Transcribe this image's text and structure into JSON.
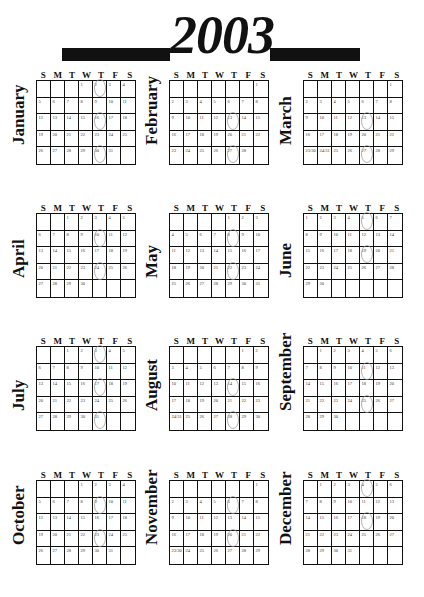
{
  "title": {
    "year": "2003"
  },
  "weekday_headers": [
    "S",
    "M",
    "T",
    "W",
    "T",
    "F",
    "S"
  ],
  "months": [
    {
      "name": "January",
      "start": 3,
      "cells": [
        "",
        "",
        "",
        "1",
        "2",
        "3",
        "4",
        "5",
        "6",
        "7",
        "8",
        "9",
        "10",
        "11",
        "12",
        "13",
        "14",
        "15",
        "16",
        "17",
        "18",
        "19",
        "20",
        "21",
        "22",
        "23",
        "24",
        "25",
        "26",
        "27",
        "28",
        "29",
        "30",
        "31",
        "",
        "",
        "",
        ""
      ],
      "circled": [
        "2",
        "16",
        "30"
      ]
    },
    {
      "name": "February",
      "start": 6,
      "cells": [
        "",
        "",
        "",
        "",
        "",
        "",
        "1",
        "2",
        "3",
        "4",
        "5",
        "6",
        "7",
        "8",
        "9",
        "10",
        "11",
        "12",
        "13",
        "14",
        "15",
        "16",
        "17",
        "18",
        "19",
        "20",
        "21",
        "22",
        "23",
        "24",
        "25",
        "26",
        "27",
        "28",
        ""
      ],
      "circled": [
        "13",
        "27"
      ]
    },
    {
      "name": "March",
      "start": 6,
      "cells": [
        "",
        "",
        "",
        "",
        "",
        "",
        "1",
        "2",
        "3",
        "4",
        "5",
        "6",
        "7",
        "8",
        "9",
        "10",
        "11",
        "12",
        "13",
        "14",
        "15",
        "16",
        "17",
        "18",
        "19",
        "20",
        "21",
        "22",
        "23/30",
        "24/31",
        "25",
        "26",
        "27",
        "28",
        "29"
      ],
      "circled": [
        "13",
        "27"
      ]
    },
    {
      "name": "April",
      "start": 2,
      "cells": [
        "",
        "",
        "1",
        "2",
        "3",
        "4",
        "5",
        "6",
        "7",
        "8",
        "9",
        "10",
        "11",
        "12",
        "13",
        "14",
        "15",
        "16",
        "17",
        "18",
        "19",
        "20",
        "21",
        "22",
        "23",
        "24",
        "25",
        "26",
        "27",
        "28",
        "29",
        "30",
        "",
        "",
        "",
        "",
        ""
      ],
      "circled": [
        "10",
        "24"
      ]
    },
    {
      "name": "May",
      "start": 4,
      "cells": [
        "",
        "",
        "",
        "",
        "1",
        "2",
        "3",
        "4",
        "5",
        "6",
        "7",
        "8",
        "9",
        "10",
        "11",
        "12",
        "13",
        "14",
        "15",
        "16",
        "17",
        "18",
        "19",
        "20",
        "21",
        "22",
        "23",
        "24",
        "25",
        "26",
        "27",
        "28",
        "29",
        "30",
        "31"
      ],
      "circled": [
        "8",
        "22"
      ]
    },
    {
      "name": "June",
      "start": 0,
      "cells": [
        "1",
        "2",
        "3",
        "4",
        "5",
        "6",
        "7",
        "8",
        "9",
        "10",
        "11",
        "12",
        "13",
        "14",
        "15",
        "16",
        "17",
        "18",
        "19",
        "20",
        "21",
        "22",
        "23",
        "24",
        "25",
        "26",
        "27",
        "28",
        "29",
        "30",
        "",
        "",
        "",
        "",
        ""
      ],
      "circled": [
        "5",
        "19"
      ]
    },
    {
      "name": "July",
      "start": 2,
      "cells": [
        "",
        "",
        "1",
        "2",
        "3",
        "4",
        "5",
        "6",
        "7",
        "8",
        "9",
        "10",
        "11",
        "12",
        "13",
        "14",
        "15",
        "16",
        "17",
        "18",
        "19",
        "20",
        "21",
        "22",
        "23",
        "24",
        "25",
        "26",
        "27",
        "28",
        "29",
        "30",
        "31",
        "",
        ""
      ],
      "circled": [
        "3",
        "17",
        "31"
      ]
    },
    {
      "name": "August",
      "start": 5,
      "cells": [
        "",
        "",
        "",
        "",
        "",
        "1",
        "2",
        "3",
        "4",
        "5",
        "6",
        "7",
        "8",
        "9",
        "10",
        "11",
        "12",
        "13",
        "14",
        "15",
        "16",
        "17",
        "18",
        "19",
        "20",
        "21",
        "22",
        "23",
        "24/31",
        "25",
        "26",
        "27",
        "28",
        "29",
        "30"
      ],
      "circled": [
        "14",
        "28"
      ]
    },
    {
      "name": "September",
      "start": 1,
      "cells": [
        "",
        "1",
        "2",
        "3",
        "4",
        "5",
        "6",
        "7",
        "8",
        "9",
        "10",
        "11",
        "12",
        "13",
        "14",
        "15",
        "16",
        "17",
        "18",
        "19",
        "20",
        "21",
        "22",
        "23",
        "24",
        "25",
        "26",
        "27",
        "28",
        "29",
        "30",
        "",
        "",
        "",
        ""
      ],
      "circled": [
        "11",
        "25"
      ]
    },
    {
      "name": "October",
      "start": 3,
      "cells": [
        "",
        "",
        "",
        "1",
        "2",
        "3",
        "4",
        "5",
        "6",
        "7",
        "8",
        "9",
        "10",
        "11",
        "12",
        "13",
        "14",
        "15",
        "16",
        "17",
        "18",
        "19",
        "20",
        "21",
        "22",
        "23",
        "24",
        "25",
        "26",
        "27",
        "28",
        "29",
        "30",
        "31",
        ""
      ],
      "circled": [
        "9",
        "23"
      ]
    },
    {
      "name": "November",
      "start": 6,
      "cells": [
        "",
        "",
        "",
        "",
        "",
        "",
        "1",
        "2",
        "3",
        "4",
        "5",
        "6",
        "7",
        "8",
        "9",
        "10",
        "11",
        "12",
        "13",
        "14",
        "15",
        "16",
        "17",
        "18",
        "19",
        "20",
        "21",
        "22",
        "23/30",
        "24",
        "25",
        "26",
        "27",
        "28",
        "29"
      ],
      "circled": [
        "6",
        "20"
      ]
    },
    {
      "name": "December",
      "start": 1,
      "cells": [
        "",
        "1",
        "2",
        "3",
        "4",
        "5",
        "6",
        "7",
        "8",
        "9",
        "10",
        "11",
        "12",
        "13",
        "14",
        "15",
        "16",
        "17",
        "18",
        "19",
        "20",
        "21",
        "22",
        "23",
        "24",
        "25",
        "26",
        "27",
        "28",
        "29",
        "30",
        "31",
        "",
        "",
        ""
      ],
      "circled": [
        "4",
        "18"
      ]
    }
  ]
}
